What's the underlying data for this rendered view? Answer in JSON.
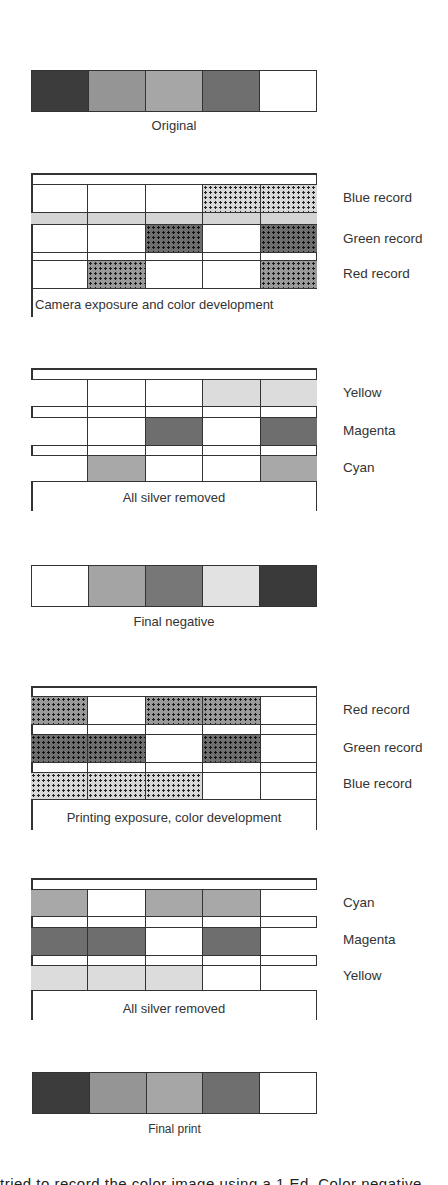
{
  "diagram": {
    "type": "subtractive color negative/print process",
    "colors": {
      "white": "#ffffff",
      "black_strip": "#3c3c3c",
      "gray_medium": "#9a9a9a",
      "gray_light2": "#a8a8a8",
      "gray_dark": "#6e6e6e",
      "gray_pale": "#dcdcdc",
      "outline": "#333333"
    },
    "original": {
      "caption": "Original",
      "cells": [
        "#3c3c3c",
        "#959595",
        "#a6a6a6",
        "#6f6f6f",
        "#ffffff"
      ]
    },
    "camera_exposure": {
      "caption": "Camera exposure and color development",
      "layers": [
        {
          "label": "Blue record",
          "cells": [
            "empty",
            "empty",
            "empty",
            "dot-light",
            "dot-light"
          ]
        },
        {
          "label": "Green record",
          "cells": [
            "empty",
            "empty",
            "dot-dark",
            "empty",
            "dot-dark"
          ]
        },
        {
          "label": "Red record",
          "cells": [
            "empty",
            "dot-mid",
            "empty",
            "empty",
            "dot-mid"
          ]
        }
      ]
    },
    "negative_dyes": {
      "caption": "All silver removed",
      "layers": [
        {
          "label": "Yellow",
          "cells": [
            "#ffffff",
            "#ffffff",
            "#ffffff",
            "#dcdcdc",
            "#dcdcdc"
          ]
        },
        {
          "label": "Magenta",
          "cells": [
            "#ffffff",
            "#ffffff",
            "#6e6e6e",
            "#ffffff",
            "#6e6e6e"
          ]
        },
        {
          "label": "Cyan",
          "cells": [
            "#ffffff",
            "#a8a8a8",
            "#ffffff",
            "#ffffff",
            "#a8a8a8"
          ]
        }
      ]
    },
    "final_negative": {
      "caption": "Final negative",
      "cells": [
        "#ffffff",
        "#a4a4a4",
        "#777777",
        "#e2e2e2",
        "#3a3a3a"
      ]
    },
    "printing_exposure": {
      "caption": "Printing exposure, color development",
      "layers": [
        {
          "label": "Red record",
          "cells": [
            "dot-mid",
            "empty",
            "dot-mid",
            "dot-mid",
            "empty"
          ]
        },
        {
          "label": "Green record",
          "cells": [
            "dot-dark",
            "dot-dark",
            "empty",
            "dot-dark",
            "empty"
          ]
        },
        {
          "label": "Blue record",
          "cells": [
            "dot-light",
            "dot-light",
            "dot-light",
            "empty",
            "empty"
          ]
        }
      ]
    },
    "print_dyes": {
      "caption": "All silver removed",
      "layers": [
        {
          "label": "Cyan",
          "cells": [
            "#a8a8a8",
            "#ffffff",
            "#a8a8a8",
            "#a8a8a8",
            "#ffffff"
          ]
        },
        {
          "label": "Magenta",
          "cells": [
            "#6e6e6e",
            "#6e6e6e",
            "#ffffff",
            "#6e6e6e",
            "#ffffff"
          ]
        },
        {
          "label": "Yellow",
          "cells": [
            "#dcdcdc",
            "#dcdcdc",
            "#dcdcdc",
            "#ffffff",
            "#ffffff"
          ]
        }
      ]
    },
    "final_print": {
      "caption": "Final print",
      "cells": [
        "#3c3c3c",
        "#959595",
        "#a6a6a6",
        "#6f6f6f",
        "#ffffff"
      ]
    },
    "cut_off_text": "tried to record the color image using a 1 Ed. Color negative"
  }
}
